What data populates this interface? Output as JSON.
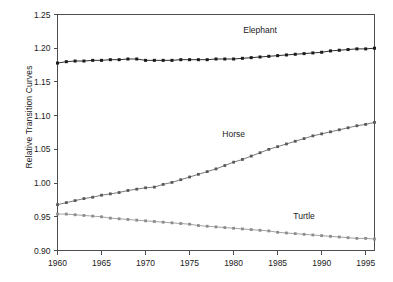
{
  "chart_data": {
    "type": "line",
    "title": "",
    "xlabel": "",
    "ylabel": "Relative Transition Curves",
    "xlim": [
      1960,
      1996
    ],
    "ylim": [
      0.9,
      1.25
    ],
    "yticks": [
      0.9,
      0.95,
      1.0,
      1.05,
      1.1,
      1.15,
      1.2,
      1.25
    ],
    "ytick_labels": [
      "0.90",
      "0.95",
      "1.00",
      "1.05",
      "1.10",
      "1.15",
      "1.20",
      "1.25"
    ],
    "xticks": [
      1960,
      1965,
      1970,
      1975,
      1980,
      1985,
      1990,
      1995
    ],
    "xtick_labels": [
      "1960",
      "1965",
      "1970",
      "1975",
      "1980",
      "1985",
      "1990",
      "1995"
    ],
    "grid": false,
    "legend_position": "inline-annotations",
    "marker": "square",
    "x": [
      1960,
      1961,
      1962,
      1963,
      1964,
      1965,
      1966,
      1967,
      1968,
      1969,
      1970,
      1971,
      1972,
      1973,
      1974,
      1975,
      1976,
      1977,
      1978,
      1979,
      1980,
      1981,
      1982,
      1983,
      1984,
      1985,
      1986,
      1987,
      1988,
      1989,
      1990,
      1991,
      1992,
      1993,
      1994,
      1995,
      1996
    ],
    "series": [
      {
        "name": "Elephant",
        "color": "#1a1a1a",
        "label_x": 1983,
        "label_y": 1.222,
        "values": [
          1.178,
          1.18,
          1.181,
          1.181,
          1.182,
          1.182,
          1.183,
          1.183,
          1.184,
          1.184,
          1.182,
          1.182,
          1.182,
          1.182,
          1.183,
          1.183,
          1.183,
          1.183,
          1.184,
          1.184,
          1.184,
          1.185,
          1.186,
          1.187,
          1.188,
          1.189,
          1.19,
          1.191,
          1.192,
          1.193,
          1.194,
          1.196,
          1.197,
          1.198,
          1.199,
          1.199,
          1.2
        ]
      },
      {
        "name": "Horse",
        "color": "#595959",
        "label_x": 1980,
        "label_y": 1.069,
        "values": [
          0.968,
          0.971,
          0.974,
          0.977,
          0.979,
          0.982,
          0.984,
          0.986,
          0.989,
          0.991,
          0.993,
          0.994,
          0.998,
          1.001,
          1.005,
          1.009,
          1.013,
          1.017,
          1.021,
          1.026,
          1.031,
          1.035,
          1.04,
          1.045,
          1.05,
          1.054,
          1.058,
          1.062,
          1.066,
          1.07,
          1.073,
          1.076,
          1.079,
          1.082,
          1.085,
          1.087,
          1.09
        ]
      },
      {
        "name": "Turtle",
        "color": "#8c8c8c",
        "label_x": 1988,
        "label_y": 0.947,
        "values": [
          0.954,
          0.954,
          0.953,
          0.952,
          0.951,
          0.95,
          0.948,
          0.947,
          0.946,
          0.945,
          0.944,
          0.943,
          0.942,
          0.941,
          0.94,
          0.939,
          0.937,
          0.936,
          0.935,
          0.934,
          0.933,
          0.932,
          0.931,
          0.93,
          0.929,
          0.927,
          0.926,
          0.925,
          0.924,
          0.923,
          0.922,
          0.921,
          0.92,
          0.919,
          0.918,
          0.918,
          0.917
        ]
      }
    ]
  }
}
